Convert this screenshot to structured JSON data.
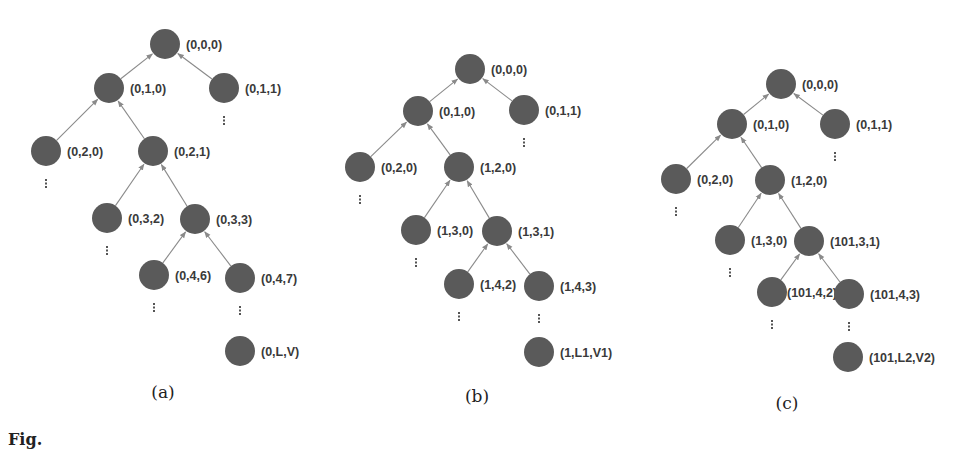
{
  "figure": {
    "caption_fragment": "Fig.",
    "node_color": "#5a5a5a",
    "edge_color": "#8a8a8a",
    "node_radius": 15,
    "panels": [
      {
        "id": "a",
        "subcaption": "(a)",
        "subcaption_pos": [
          163,
          398
        ],
        "nodes": [
          {
            "id": "a0",
            "label": "(0,0,0)",
            "x": 165,
            "y": 44
          },
          {
            "id": "a1",
            "label": "(0,1,0)",
            "x": 109,
            "y": 88
          },
          {
            "id": "a2",
            "label": "(0,1,1)",
            "x": 224,
            "y": 88,
            "continues": true
          },
          {
            "id": "a3",
            "label": "(0,2,0)",
            "x": 46,
            "y": 151,
            "continues": true
          },
          {
            "id": "a4",
            "label": "(0,2,1)",
            "x": 153,
            "y": 151
          },
          {
            "id": "a5",
            "label": "(0,3,2)",
            "x": 107,
            "y": 218,
            "continues": true
          },
          {
            "id": "a6",
            "label": "(0,3,3)",
            "x": 195,
            "y": 219
          },
          {
            "id": "a7",
            "label": "(0,4,6)",
            "x": 154,
            "y": 275,
            "continues": true
          },
          {
            "id": "a8",
            "label": "(0,4,7)",
            "x": 240,
            "y": 278,
            "continues": true
          },
          {
            "id": "a9",
            "label": "(0,L,V)",
            "x": 240,
            "y": 351
          }
        ],
        "edges": [
          [
            "a1",
            "a0"
          ],
          [
            "a2",
            "a0"
          ],
          [
            "a3",
            "a1"
          ],
          [
            "a4",
            "a1"
          ],
          [
            "a5",
            "a4"
          ],
          [
            "a6",
            "a4"
          ],
          [
            "a7",
            "a6"
          ],
          [
            "a8",
            "a6"
          ]
        ]
      },
      {
        "id": "b",
        "subcaption": "(b)",
        "subcaption_pos": [
          477,
          402
        ],
        "nodes": [
          {
            "id": "b0",
            "label": "(0,0,0)",
            "x": 470,
            "y": 69
          },
          {
            "id": "b1",
            "label": "(0,1,0)",
            "x": 418,
            "y": 111
          },
          {
            "id": "b2",
            "label": "(0,1,1)",
            "x": 524,
            "y": 110,
            "continues": true
          },
          {
            "id": "b3",
            "label": "(0,2,0)",
            "x": 360,
            "y": 167,
            "continues": true
          },
          {
            "id": "b4",
            "label": "(1,2,0)",
            "x": 459,
            "y": 167
          },
          {
            "id": "b5",
            "label": "(1,3,0)",
            "x": 416,
            "y": 230,
            "continues": true
          },
          {
            "id": "b6",
            "label": "(1,3,1)",
            "x": 497,
            "y": 231
          },
          {
            "id": "b7",
            "label": "(1,4,2)",
            "x": 459,
            "y": 284,
            "continues": true
          },
          {
            "id": "b8",
            "label": "(1,4,3)",
            "x": 539,
            "y": 286,
            "continues": true
          },
          {
            "id": "b9",
            "label": "(1,L1,V1)",
            "x": 539,
            "y": 352
          }
        ],
        "edges": [
          [
            "b1",
            "b0"
          ],
          [
            "b2",
            "b0"
          ],
          [
            "b3",
            "b1"
          ],
          [
            "b4",
            "b1"
          ],
          [
            "b5",
            "b4"
          ],
          [
            "b6",
            "b4"
          ],
          [
            "b7",
            "b6"
          ],
          [
            "b8",
            "b6"
          ]
        ]
      },
      {
        "id": "c",
        "subcaption": "(c)",
        "subcaption_pos": [
          787,
          409
        ],
        "nodes": [
          {
            "id": "c0",
            "label": "(0,0,0)",
            "x": 781,
            "y": 84
          },
          {
            "id": "c1",
            "label": "(0,1,0)",
            "x": 732,
            "y": 124
          },
          {
            "id": "c2",
            "label": "(0,1,1)",
            "x": 835,
            "y": 124,
            "continues": true
          },
          {
            "id": "c3",
            "label": "(0,2,0)",
            "x": 676,
            "y": 179,
            "continues": true
          },
          {
            "id": "c4",
            "label": "(1,2,0)",
            "x": 770,
            "y": 180
          },
          {
            "id": "c5",
            "label": "(1,3,0)",
            "x": 730,
            "y": 240,
            "continues": true
          },
          {
            "id": "c6",
            "label": "(101,3,1)",
            "x": 809,
            "y": 241
          },
          {
            "id": "c7",
            "label": "(101,4,2)",
            "x": 772,
            "y": 292,
            "continues": true,
            "label_dx": 12
          },
          {
            "id": "c8",
            "label": "(101,4,3)",
            "x": 849,
            "y": 294,
            "continues": true
          },
          {
            "id": "c9",
            "label": "(101,L2,V2)",
            "x": 848,
            "y": 357
          }
        ],
        "edges": [
          [
            "c1",
            "c0"
          ],
          [
            "c2",
            "c0"
          ],
          [
            "c3",
            "c1"
          ],
          [
            "c4",
            "c1"
          ],
          [
            "c5",
            "c4"
          ],
          [
            "c6",
            "c4"
          ],
          [
            "c7",
            "c6"
          ],
          [
            "c8",
            "c6"
          ]
        ]
      }
    ]
  }
}
